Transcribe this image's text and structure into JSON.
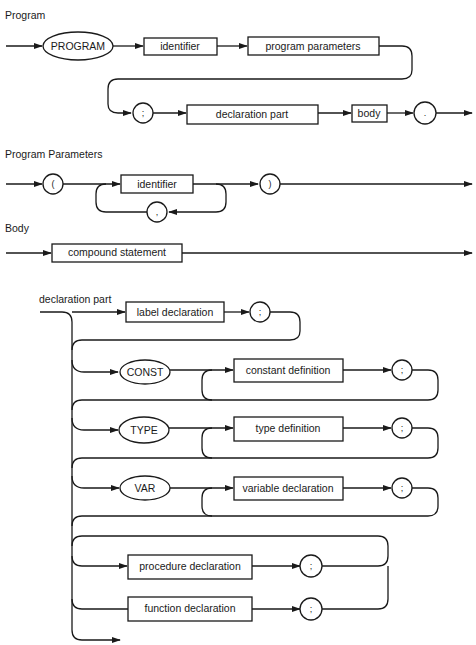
{
  "sections": {
    "program": {
      "title": "Program",
      "keyword": "PROGRAM",
      "identifier": "identifier",
      "program_parameters": "program parameters",
      "semicolon": ";",
      "declaration_part": "declaration part",
      "body": "body",
      "period": "."
    },
    "program_parameters": {
      "title": "Program Parameters",
      "open_paren": "(",
      "identifier": "identifier",
      "comma": ",",
      "close_paren": ")"
    },
    "body": {
      "title": "Body",
      "compound_statement": "compound statement"
    },
    "declaration_part": {
      "title": "declaration part",
      "label_declaration": "label declaration",
      "const_keyword": "CONST",
      "constant_definition": "constant definition",
      "type_keyword": "TYPE",
      "type_definition": "type definition",
      "var_keyword": "VAR",
      "variable_declaration": "variable declaration",
      "procedure_declaration": "procedure declaration",
      "function_declaration": "function declaration",
      "semicolon": ";"
    }
  },
  "colors": {
    "ink": "#1a1a1a",
    "paper": "#ffffff"
  }
}
